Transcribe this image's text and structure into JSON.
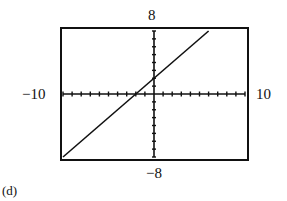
{
  "chart_data": {
    "type": "line",
    "title": "",
    "panel_label": "(d)",
    "xlabel": "",
    "ylabel": "",
    "xlim": [
      -10,
      10
    ],
    "ylim": [
      -8,
      8
    ],
    "tick_labels": {
      "xmin": "−10",
      "xmax": "10",
      "ymin": "−8",
      "ymax": "8"
    },
    "xscale_ticks": 1,
    "yscale_ticks": 1,
    "grid": false,
    "series": [
      {
        "name": "graph",
        "x": [
          -10,
          6
        ],
        "y": [
          -8,
          8
        ],
        "equation_estimate": "y = x + 2"
      }
    ],
    "colors": {
      "line": "#111111",
      "frame": "#111111",
      "background": "#ffffff"
    }
  }
}
